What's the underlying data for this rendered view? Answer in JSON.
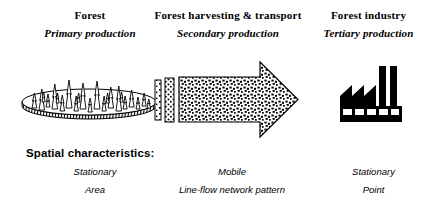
{
  "diagram": {
    "columns": [
      {
        "title": "Forest",
        "subtitle": "Primary production",
        "graphic": "forest-disk-with-trees-icon",
        "attr_1": "Stationary",
        "attr_2": "Area"
      },
      {
        "title": "Forest harvesting & transport",
        "subtitle": "Secondary production",
        "graphic": "speckled-right-arrow-icon",
        "attr_1": "Mobile",
        "attr_2": "Line-flow network pattern"
      },
      {
        "title": "Forest industry",
        "subtitle": "Tertiary production",
        "graphic": "factory-icon",
        "attr_1": "Stationary",
        "attr_2": "Point"
      }
    ],
    "spatial_label": "Spatial characteristics:",
    "colors": {
      "ink": "#000000",
      "background": "#ffffff"
    }
  }
}
